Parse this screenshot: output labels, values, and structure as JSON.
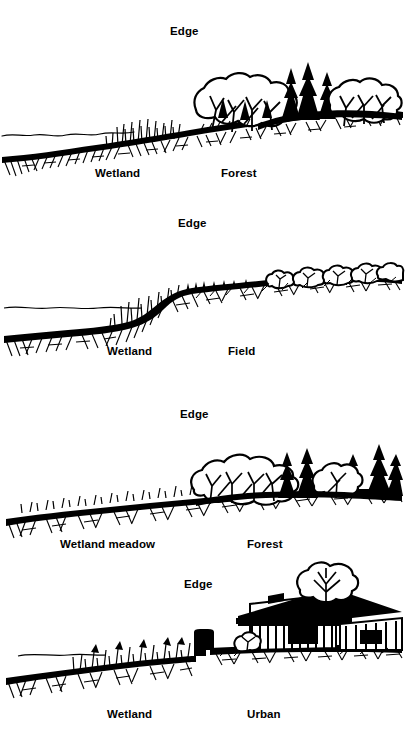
{
  "figure": {
    "background_color": "#ffffff",
    "ink_color": "#000000",
    "panels": [
      {
        "id": "panel-forest",
        "edge_label": "Edge",
        "left_label": "Wetland",
        "right_label": "Forest",
        "scene": "wetland sloping up to mature mixed forest with deciduous canopy and conifers"
      },
      {
        "id": "panel-field",
        "edge_label": "Edge",
        "left_label": "Wetland",
        "right_label": "Field",
        "scene": "wetland rising by steep bank to open field with low shrub hedgerow"
      },
      {
        "id": "panel-wetland-meadow",
        "edge_label": "Edge",
        "left_label": "Wetland meadow",
        "right_label": "Forest",
        "scene": "wetland meadow grading into forest of deciduous trees and dark conifers"
      },
      {
        "id": "panel-urban",
        "edge_label": "Edge",
        "left_label": "Wetland",
        "right_label": "Urban",
        "scene": "wetland meeting a retaining wall with a house and shade tree on filled ground"
      }
    ]
  }
}
